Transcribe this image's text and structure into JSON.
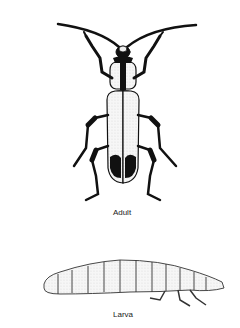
{
  "figure": {
    "style": "black and white stippled line drawing",
    "colors": {
      "background": "#ffffff",
      "ink": "#111111",
      "stipple": "#e6e6e6"
    }
  },
  "adult": {
    "label": "Adult"
  },
  "larva": {
    "label": "Larva"
  }
}
